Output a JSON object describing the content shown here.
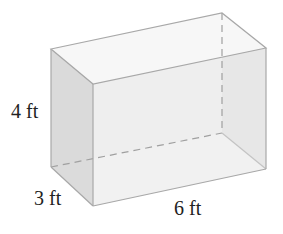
{
  "figure": {
    "type": "rectangular-prism",
    "labels": {
      "height": "4 ft",
      "depth": "3 ft",
      "length": "6 ft"
    },
    "colors": {
      "edge": "#a8a8a8",
      "front_face": "#ececec",
      "side_face": "#d9d9d9",
      "top_face": "#f6f6f6",
      "bottom_face": "#f9f9f9"
    }
  }
}
